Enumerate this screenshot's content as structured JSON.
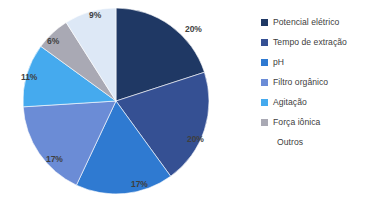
{
  "chart_data": {
    "type": "pie",
    "title": "",
    "categories": [
      "Potencial elétrico",
      "Tempo de extração",
      "pH",
      "Filtro orgânico",
      "Agitação",
      "Força iônica",
      "Outros"
    ],
    "values": [
      20,
      20,
      17,
      17,
      11,
      6,
      9
    ],
    "value_labels": [
      "20%",
      "20%",
      "17%",
      "17%",
      "11%",
      "6%",
      "9%"
    ],
    "colors": [
      "#1f3864",
      "#355093",
      "#2f7ad1",
      "#6b8cd6",
      "#45aaee",
      "#a9a9b4",
      "#dde8f6"
    ],
    "units": "percent",
    "start_angle_deg": 0,
    "direction": "clockwise",
    "grid": false,
    "legend": {
      "position": "right",
      "entries": [
        {
          "label": "Potencial elétrico",
          "color": "#1f3864",
          "has_marker": true
        },
        {
          "label": "Tempo de extração",
          "color": "#355093",
          "has_marker": true
        },
        {
          "label": "pH",
          "color": "#2f7ad1",
          "has_marker": true
        },
        {
          "label": "Filtro orgânico",
          "color": "#6b8cd6",
          "has_marker": true
        },
        {
          "label": "Agitação",
          "color": "#45aaee",
          "has_marker": true
        },
        {
          "label": "Força iônica",
          "color": "#a9a9b4",
          "has_marker": true
        },
        {
          "label": "Outros",
          "color": "#eef5fc",
          "has_marker": false
        }
      ]
    },
    "labels_layout": [
      {
        "text": "20%",
        "x": 185,
        "y": 24
      },
      {
        "text": "20%",
        "x": 187,
        "y": 134
      },
      {
        "text": "17%",
        "x": 131,
        "y": 179
      },
      {
        "text": "17%",
        "x": 46,
        "y": 154
      },
      {
        "text": "11%",
        "x": 21,
        "y": 72
      },
      {
        "text": "6%",
        "x": 47,
        "y": 36
      },
      {
        "text": "9%",
        "x": 89,
        "y": 10
      }
    ]
  }
}
